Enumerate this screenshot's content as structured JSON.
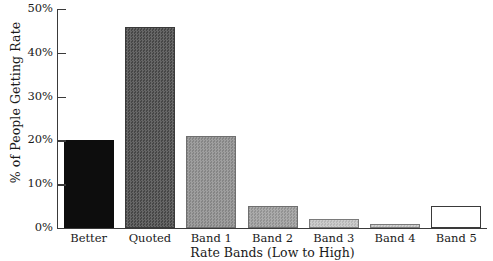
{
  "chart_data": {
    "type": "bar",
    "title": "",
    "xlabel": "Rate Bands (Low to High)",
    "ylabel": "% of People Getting Rate",
    "categories": [
      "Better",
      "Quoted",
      "Band 1",
      "Band 2",
      "Band 3",
      "Band 4",
      "Band 5"
    ],
    "values": [
      20,
      46,
      21,
      5,
      2,
      1,
      5
    ],
    "ylim": [
      0,
      50
    ],
    "yticks": [
      0,
      10,
      20,
      30,
      40,
      50
    ],
    "ytick_labels": [
      "0%",
      "10%",
      "20%",
      "30%",
      "40%",
      "50%"
    ],
    "grid": false,
    "legend": false,
    "bar_styles": [
      {
        "category": "Better",
        "fill": "#0d0d0d",
        "stroke": "#0d0d0d",
        "pattern": "solid-dark"
      },
      {
        "category": "Quoted",
        "fill": "#4a4a4a",
        "stroke": "#3a3a3a",
        "pattern": "dither-dark-gray"
      },
      {
        "category": "Band 1",
        "fill": "#8d8d8d",
        "stroke": "#6f6f6f",
        "pattern": "dither-mid-gray"
      },
      {
        "category": "Band 2",
        "fill": "#9b9b9b",
        "stroke": "#6f6f6f",
        "pattern": "dither-mid-gray"
      },
      {
        "category": "Band 3",
        "fill": "#c2c2c2",
        "stroke": "#7a7a7a",
        "pattern": "dither-light-gray"
      },
      {
        "category": "Band 4",
        "fill": "#c9c9c9",
        "stroke": "#7a7a7a",
        "pattern": "dither-light-gray"
      },
      {
        "category": "Band 5",
        "fill": "#ffffff",
        "stroke": "#3a3a3a",
        "pattern": "outline-only"
      }
    ]
  },
  "axis": {
    "y_title": "% of People Getting Rate",
    "x_title": "Rate Bands (Low to High)",
    "y_labels": [
      "50%",
      "40%",
      "30%",
      "20%",
      "10%",
      "0%"
    ],
    "x_labels": [
      "Better",
      "Quoted",
      "Band 1",
      "Band 2",
      "Band 3",
      "Band 4",
      "Band 5"
    ]
  },
  "colors": {
    "axis": "#3a3a3a",
    "text": "#1a1a1a",
    "background": "#ffffff"
  }
}
